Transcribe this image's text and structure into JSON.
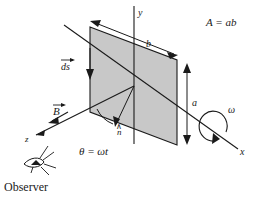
{
  "figure": {
    "background_color": "#ffffff",
    "line_color": "#1a1a1a",
    "loop_fill_color": "#c8c8c8"
  },
  "axes": {
    "y_label": "y",
    "x_label": "x",
    "z_label": "z"
  },
  "labels": {
    "area": "A = ab",
    "side_b": "b",
    "side_a": "a",
    "ds_vector": "ds",
    "b_field": "B",
    "normal": "n",
    "angle": "θ = ωt",
    "omega": "ω",
    "observer": "Observer"
  },
  "annotations": {
    "hat_symbol": "∧",
    "vector_arrow": "→"
  }
}
